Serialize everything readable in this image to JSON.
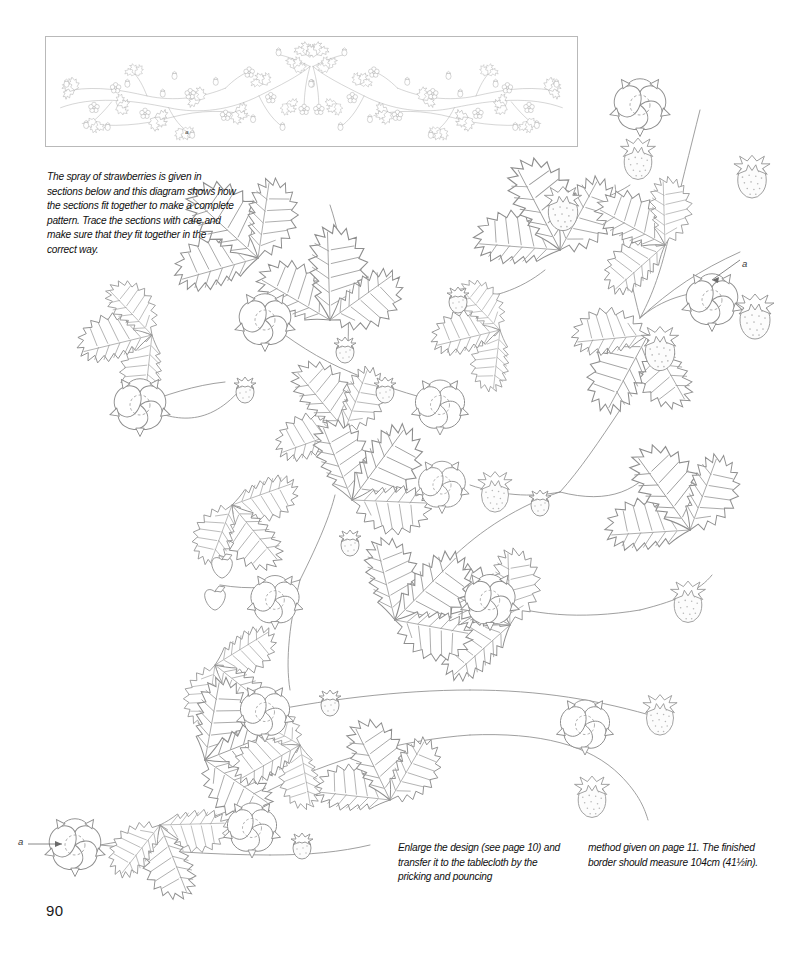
{
  "page": {
    "number": "90",
    "title": "The spray of strawberries",
    "background_color": "#ffffff",
    "line_color": "#8e8e8e",
    "width": 792,
    "height": 956
  },
  "diagram_box": {
    "label": "complete-border-layout-diagram",
    "description": "Miniature line drawing of the full symmetrical strawberry garland border, showing how the traced sections join into one continuous pattern.",
    "marker_label": "a"
  },
  "captions": {
    "intro": "The spray of strawberries is given in sections below and this diagram shows how the sections fit together to make a complete pattern. Trace the sections with care and make sure that they fit together in the correct way.",
    "bottom_left": "Enlarge the design (see page 10) and transfer it to the tablecloth by the pricking and pouncing",
    "bottom_right": "method given on page 11. The finished border should measure 104cm (41½in)."
  },
  "markers": [
    {
      "id": "marker-a-right",
      "label": "a",
      "points_to": "flower-upper-right"
    },
    {
      "id": "marker-a-left",
      "label": "a",
      "points_to": "flower-lower-left"
    }
  ],
  "motifs": {
    "leaf": "strawberry-trifoliate-leaf",
    "flower": "strawberry-five-petal-flower",
    "fruit": "strawberry-fruit",
    "stem": "strawberry-runner-stem"
  },
  "artwork": {
    "title": "Strawberry spray pattern sections",
    "description": "Large-scale line-art sections of the strawberry spray: serrated trifoliate leaves, five-petal flowers with dashed centres, and stippled berries linked by curving runner stems."
  }
}
